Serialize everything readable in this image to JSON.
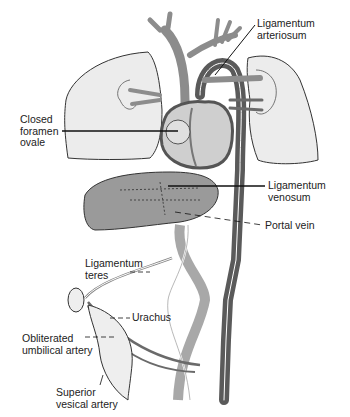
{
  "diagram": {
    "labels": [
      {
        "id": "ligamentum-arteriosum",
        "lines": [
          "Ligamentum",
          "arteriosum"
        ]
      },
      {
        "id": "closed-foramen-ovale",
        "lines": [
          "Closed",
          "foramen",
          "ovale"
        ]
      },
      {
        "id": "ligamentum-venosum",
        "lines": [
          "Ligamentum",
          "venosum"
        ]
      },
      {
        "id": "portal-vein",
        "lines": [
          "Portal vein"
        ]
      },
      {
        "id": "ligamentum-teres",
        "lines": [
          "Ligamentum",
          "teres"
        ]
      },
      {
        "id": "urachus",
        "lines": [
          "Urachus"
        ]
      },
      {
        "id": "obliterated-umbilical-artery",
        "lines": [
          "Obliterated",
          "umbilical artery"
        ]
      },
      {
        "id": "superior-vesical-artery",
        "lines": [
          "Superior",
          "vesical artery"
        ]
      }
    ],
    "colors": {
      "vessel_dark": "#5a5a5a",
      "vessel_mid": "#8c8c8c",
      "vessel_light": "#a8a8a8",
      "lung_fill": "#ececec",
      "liver_fill": "#9a9a9a",
      "heart_fill": "#cfcfcf",
      "outline": "#333333"
    }
  }
}
